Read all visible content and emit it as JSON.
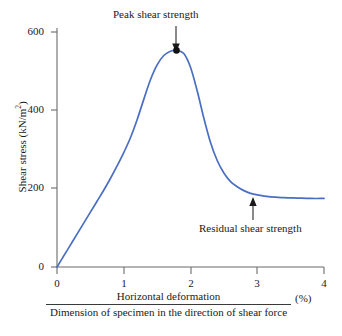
{
  "chart_data": {
    "type": "line",
    "title": "",
    "xlabel_numerator": "Horizontal deformation",
    "xlabel_denominator": "Dimension of specimen in the direction of shear force",
    "xlabel_unit": "(%)",
    "ylabel": "Shear stress (kN/m",
    "ylabel_sup": "2",
    "ylabel_close": ")",
    "xlim": [
      0,
      4
    ],
    "ylim": [
      0,
      640
    ],
    "xticks": [
      "0",
      "1",
      "2",
      "3",
      "4"
    ],
    "xtick_values": [
      0,
      1,
      2,
      3,
      4
    ],
    "yticks": [
      "0",
      "200",
      "400",
      "600"
    ],
    "ytick_values": [
      0,
      200,
      400,
      600
    ],
    "grid": false,
    "legend": "none",
    "series": [
      {
        "name": "Shear stress vs horizontal deformation",
        "color": "#4a6fc2",
        "x": [
          0.0,
          0.1,
          0.2,
          0.3,
          0.4,
          0.5,
          0.6,
          0.7,
          0.8,
          0.9,
          1.0,
          1.1,
          1.2,
          1.3,
          1.4,
          1.5,
          1.6,
          1.7,
          1.8,
          1.9,
          2.0,
          2.1,
          2.2,
          2.3,
          2.4,
          2.5,
          2.6,
          2.7,
          2.8,
          2.9,
          3.0,
          3.2,
          3.4,
          3.6,
          3.8,
          4.0
        ],
        "y": [
          0,
          28,
          56,
          84,
          112,
          140,
          168,
          196,
          226,
          258,
          292,
          330,
          376,
          428,
          478,
          516,
          540,
          551,
          553,
          545,
          510,
          450,
          380,
          318,
          272,
          240,
          218,
          205,
          195,
          188,
          184,
          179,
          177,
          176,
          175,
          175
        ]
      }
    ],
    "annotations": [
      {
        "name": "peak-shear-strength",
        "text": "Peak shear strength",
        "point_x": 1.79,
        "point_y": 553,
        "marker": "filled-circle",
        "arrow": "down"
      },
      {
        "name": "residual-shear-strength",
        "text": "Residual shear strength",
        "point_x": 3.15,
        "point_y": 178,
        "marker": "none",
        "arrow": "up"
      }
    ]
  },
  "axes": {
    "axis_color": "#6b6b6b",
    "tick_color": "#6b6b6b"
  }
}
